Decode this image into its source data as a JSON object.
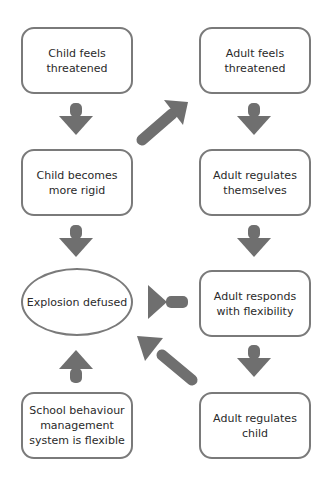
{
  "diagram": {
    "type": "flowchart",
    "colors": {
      "border": "#7a7a7a",
      "arrow": "#6f6f6f",
      "text": "#2a2a2a",
      "background": "#ffffff"
    },
    "nodes": {
      "child_threatened": "Child feels threatened",
      "child_rigid": "Child becomes more rigid",
      "explosion_defused": "Explosion defused",
      "school_system": "School behaviour management system is flexible",
      "adult_threatened": "Adult feels threatened",
      "adult_regulates_self": "Adult regulates themselves",
      "adult_flexible": "Adult responds with flexibility",
      "adult_regulates_child": "Adult regulates child"
    },
    "edges": [
      {
        "from": "Child feels threatened",
        "to": "Child becomes more rigid"
      },
      {
        "from": "Child becomes more rigid",
        "to": "Adult feels threatened"
      },
      {
        "from": "Child becomes more rigid",
        "to": "Explosion defused"
      },
      {
        "from": "Adult feels threatened",
        "to": "Adult regulates themselves"
      },
      {
        "from": "Adult regulates themselves",
        "to": "Adult responds with flexibility"
      },
      {
        "from": "Adult responds with flexibility",
        "to": "Explosion defused"
      },
      {
        "from": "Adult responds with flexibility",
        "to": "Adult regulates child"
      },
      {
        "from": "Adult regulates child",
        "to": "Explosion defused"
      },
      {
        "from": "School behaviour management system is flexible",
        "to": "Explosion defused"
      }
    ]
  }
}
